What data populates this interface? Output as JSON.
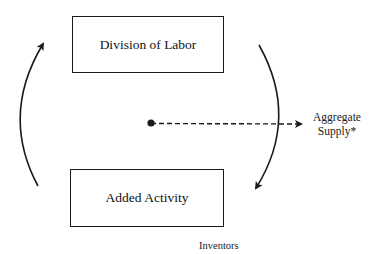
{
  "diagram": {
    "nodes": [
      {
        "id": "division",
        "label": "Division of Labor"
      },
      {
        "id": "added",
        "label": "Added Activity"
      }
    ],
    "labels": {
      "aggregate_line1": "Aggregate",
      "aggregate_line2": "Supply*",
      "inventors": "Inventors"
    },
    "edges": [
      {
        "from": "division",
        "to": "added",
        "style": "solid-curved",
        "side": "right"
      },
      {
        "from": "added",
        "to": "division",
        "style": "solid-curved",
        "side": "left"
      },
      {
        "from": "center-dot",
        "to": "aggregate-supply",
        "style": "dashed"
      }
    ],
    "colors": {
      "stroke": "#1a1a1a",
      "background": "#ffffff"
    }
  }
}
